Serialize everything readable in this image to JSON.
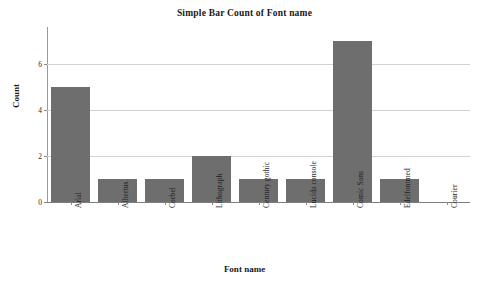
{
  "chart_data": {
    "type": "bar",
    "title": "Simple Bar Count of Font name",
    "xlabel": "Font name",
    "ylabel": "Count",
    "categories": [
      "Arial",
      "Albertus",
      "Corbel",
      "Lithograph",
      "Century gothic",
      "Lucida console",
      "Comic Sans",
      "Edelfontmed",
      "Courier"
    ],
    "values": [
      5,
      1,
      1,
      2,
      1,
      1,
      7,
      1,
      0
    ],
    "ylim": [
      0,
      7.6
    ],
    "yticks": [
      0,
      2,
      4,
      6
    ],
    "ytick_labels": [
      "0",
      "2",
      "4",
      "6"
    ],
    "grid": "horizontal",
    "legend": "none",
    "bar_color": "#6e6e6e",
    "gridline_color": "#d2d2d2",
    "axis_color": "#8a8a8a",
    "background": "#ffffff"
  }
}
